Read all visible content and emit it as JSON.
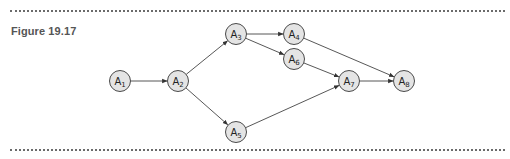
{
  "figure": {
    "title": "Figure 19.17"
  },
  "colors": {
    "node_fill": "#e4e4e4",
    "node_stroke": "#4a4a4a",
    "edge": "#444444",
    "title": "#555555",
    "rule": "#6b6b6b"
  },
  "nodes": [
    {
      "id": "A1",
      "label": "A",
      "sub": "1",
      "x": 120,
      "y": 81
    },
    {
      "id": "A2",
      "label": "A",
      "sub": "2",
      "x": 178,
      "y": 81
    },
    {
      "id": "A3",
      "label": "A",
      "sub": "3",
      "x": 236,
      "y": 34
    },
    {
      "id": "A4",
      "label": "A",
      "sub": "4",
      "x": 294,
      "y": 34
    },
    {
      "id": "A5",
      "label": "A",
      "sub": "5",
      "x": 236,
      "y": 132
    },
    {
      "id": "A6",
      "label": "A",
      "sub": "6",
      "x": 294,
      "y": 59
    },
    {
      "id": "A7",
      "label": "A",
      "sub": "7",
      "x": 349,
      "y": 81
    },
    {
      "id": "A8",
      "label": "A",
      "sub": "8",
      "x": 404,
      "y": 81
    }
  ],
  "edges": [
    {
      "from": "A1",
      "to": "A2"
    },
    {
      "from": "A2",
      "to": "A3"
    },
    {
      "from": "A2",
      "to": "A5"
    },
    {
      "from": "A3",
      "to": "A4"
    },
    {
      "from": "A3",
      "to": "A6"
    },
    {
      "from": "A4",
      "to": "A8"
    },
    {
      "from": "A6",
      "to": "A7"
    },
    {
      "from": "A5",
      "to": "A7"
    },
    {
      "from": "A7",
      "to": "A8"
    }
  ]
}
